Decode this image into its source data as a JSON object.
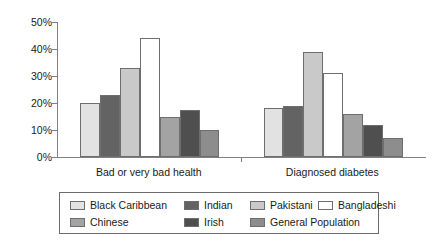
{
  "chart_data": {
    "type": "bar",
    "title": "",
    "subtitle": "",
    "xlabel": "",
    "ylabel": "",
    "categories": [
      "Bad or very bad health",
      "Diagnosed diabetes"
    ],
    "ylim": [
      0,
      50
    ],
    "ytick_values": [
      0,
      10,
      20,
      30,
      40,
      50
    ],
    "ytick_labels": [
      "0%",
      "10%",
      "20%",
      "30%",
      "40%",
      "50%"
    ],
    "grid": false,
    "legend_position": "bottom",
    "value_suffix": "%",
    "series": [
      {
        "name": "Black Caribbean",
        "color": "#e2e2e2",
        "values": [
          20,
          18
        ]
      },
      {
        "name": "Indian",
        "color": "#636363",
        "values": [
          23,
          19
        ]
      },
      {
        "name": "Pakistani",
        "color": "#c9c9c9",
        "values": [
          33,
          39
        ]
      },
      {
        "name": "Bangladeshi",
        "color": "#ffffff",
        "values": [
          44,
          31
        ]
      },
      {
        "name": "Chinese",
        "color": "#a3a3a3",
        "values": [
          15,
          16
        ]
      },
      {
        "name": "Irish",
        "color": "#4f4f4f",
        "values": [
          17.5,
          12
        ]
      },
      {
        "name": "General Population",
        "color": "#8d8d8d",
        "values": [
          10,
          7
        ]
      }
    ]
  },
  "legend": {
    "entries": [
      {
        "label": "Black Caribbean",
        "color": "#e2e2e2"
      },
      {
        "label": "Indian",
        "color": "#636363"
      },
      {
        "label": "Pakistani",
        "color": "#c9c9c9"
      },
      {
        "label": "Bangladeshi",
        "color": "#ffffff"
      },
      {
        "label": "Chinese",
        "color": "#a3a3a3"
      },
      {
        "label": "Irish",
        "color": "#4f4f4f"
      },
      {
        "label": "General Population",
        "color": "#8d8d8d"
      }
    ]
  },
  "axis": {
    "y_labels": [
      "50%",
      "40%",
      "30%",
      "20%",
      "10%",
      "0%"
    ]
  }
}
